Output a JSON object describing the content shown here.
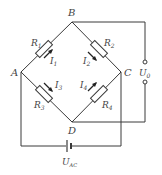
{
  "diagram": {
    "type": "Wheatstone bridge circuit",
    "colors": {
      "line": "#3a3a3a",
      "text": "#444444",
      "background": "#ffffff"
    },
    "nodes": {
      "A": {
        "label": "A"
      },
      "B": {
        "label": "B"
      },
      "C": {
        "label": "C"
      },
      "D": {
        "label": "D"
      }
    },
    "resistors": [
      {
        "name": "R1",
        "label": "R",
        "sub": "1",
        "between": "A-B",
        "current": {
          "label": "I",
          "sub": "1",
          "direction": "toward B"
        }
      },
      {
        "name": "R2",
        "label": "R",
        "sub": "2",
        "between": "B-C",
        "current": {
          "label": "I",
          "sub": "2",
          "direction": "toward C"
        }
      },
      {
        "name": "R3",
        "label": "R",
        "sub": "3",
        "between": "A-D",
        "current": {
          "label": "I",
          "sub": "3",
          "direction": "toward D"
        }
      },
      {
        "name": "R4",
        "label": "R",
        "sub": "4",
        "between": "D-C",
        "current": {
          "label": "I",
          "sub": "4",
          "direction": "toward C"
        }
      }
    ],
    "output": {
      "label": "U",
      "sub": "0",
      "between": "B-D",
      "terminals": 2
    },
    "source": {
      "label": "U",
      "sub": "AC",
      "between": "A-C",
      "symbol": "battery"
    }
  }
}
